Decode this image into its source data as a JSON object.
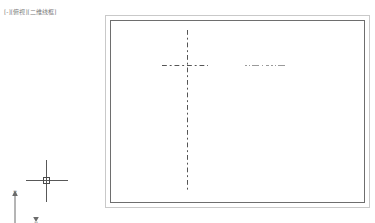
{
  "app": {
    "name": "CAD Model Space",
    "background_color": "#ffffff"
  },
  "viewport_label": {
    "expand_control": "[-]",
    "view_control": "[俯视]",
    "visual_style_control": "[二维线框]",
    "full_text": "[-][俯视][二维线框]",
    "color": "#7a7a7a"
  },
  "drawing": {
    "name": "rectangular-part-with-centerlines",
    "entities": {
      "outer_rectangle": {
        "label": "outer-rectangle",
        "color": "#c9c9c9",
        "linetype": "continuous"
      },
      "inner_rectangle": {
        "label": "inner-rectangle",
        "color": "#6e6e6e",
        "linetype": "continuous"
      },
      "vertical_centerline": {
        "label": "vertical-centerline",
        "color": "#555555",
        "linetype": "dash-dot"
      },
      "horizontal_centerline": {
        "label": "horizontal-centerline",
        "color": "#555555",
        "linetype": "dash-dot"
      },
      "secondary_centerline": {
        "label": "secondary-centerline",
        "color": "#9a9a9a",
        "linetype": "dash-dot"
      }
    }
  },
  "ucs_icon": {
    "name": "ucs-icon",
    "y_axis_label": "Y",
    "x_axis_label": "X",
    "color": "#6b6b6b"
  },
  "cursor": {
    "name": "crosshair-cursor",
    "color": "#585858",
    "has_pickbox": true
  }
}
